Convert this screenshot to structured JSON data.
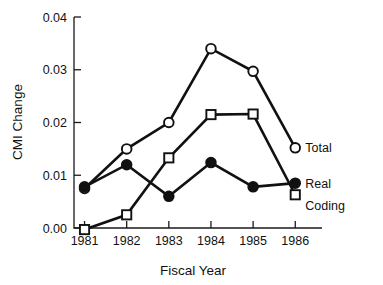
{
  "chart_data": {
    "type": "line",
    "title": "",
    "xlabel": "Fiscal Year",
    "ylabel": "CMI Change",
    "categories": [
      "1981",
      "1982",
      "1983",
      "1984",
      "1985",
      "1986"
    ],
    "x": [
      1981,
      1982,
      1983,
      1984,
      1985,
      1986
    ],
    "xlim": [
      1980.75,
      1986.35
    ],
    "ylim": [
      0.0,
      0.04
    ],
    "yticks": [
      0.0,
      0.01,
      0.02,
      0.03,
      0.04
    ],
    "ytick_labels": [
      "0.00",
      "0.01",
      "0.02",
      "0.03",
      "0.04"
    ],
    "xticks": [
      1981,
      1982,
      1983,
      1984,
      1985,
      1986
    ],
    "xtick_labels": [
      "1981",
      "1982",
      "1983",
      "1984",
      "1985",
      "1986"
    ],
    "grid": false,
    "legend_position": "right-inline-end-of-line",
    "series": [
      {
        "name": "Total",
        "marker": "open-circle",
        "color": "#111111",
        "values": [
          0.0075,
          0.015,
          0.02,
          0.034,
          0.0297,
          0.0152
        ]
      },
      {
        "name": "Real",
        "marker": "filled-circle",
        "color": "#111111",
        "values": [
          0.0078,
          0.012,
          0.006,
          0.0124,
          0.0078,
          0.0085
        ]
      },
      {
        "name": "Coding",
        "marker": "open-square",
        "color": "#111111",
        "values": [
          -0.0003,
          0.0025,
          0.0133,
          0.0215,
          0.0216,
          0.0063
        ]
      }
    ],
    "annotations": [
      {
        "text": "Total",
        "series": "Total"
      },
      {
        "text": "Real",
        "series": "Real"
      },
      {
        "text": "Coding",
        "series": "Coding"
      }
    ]
  },
  "colors": {
    "ink": "#111111",
    "background": "#ffffff"
  }
}
